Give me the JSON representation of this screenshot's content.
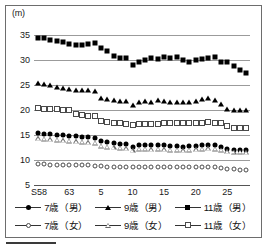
{
  "figure": {
    "unit_label": "(m)",
    "background": "#ffffff",
    "border_color": "#6d6d6d"
  },
  "axes": {
    "y_ticks": [
      "5",
      "10",
      "15",
      "20",
      "25",
      "30",
      "35"
    ],
    "y_min": 5,
    "y_max": 36.5,
    "x_ticks": [
      "S58",
      "63",
      "5",
      "10",
      "15",
      "20",
      "25"
    ],
    "x_tick_values": [
      0,
      5,
      10,
      15,
      20,
      25,
      30
    ],
    "x_min": -0.6,
    "x_max": 33.6,
    "grid": true,
    "grid_color": "#9b9b9b"
  },
  "legend": {
    "rows": [
      [
        {
          "label": "7歳（男）",
          "marker": "circle-f",
          "icon": "filled-circle-marker"
        },
        {
          "label": "9歳（男）",
          "marker": "tri-f",
          "icon": "filled-triangle-marker"
        },
        {
          "label": "11歳（男）",
          "marker": "square-f",
          "icon": "filled-square-marker"
        }
      ],
      [
        {
          "label": "7歳（女）",
          "marker": "circle-o",
          "icon": "open-circle-marker"
        },
        {
          "label": "9歳（女）",
          "marker": "tri-o",
          "icon": "open-triangle-marker"
        },
        {
          "label": "11歳（女）",
          "marker": "square-o",
          "icon": "open-square-marker"
        }
      ]
    ]
  },
  "chart_data": {
    "type": "line",
    "title": "",
    "subtitle": "",
    "xlabel": "",
    "ylabel": "(m)",
    "ylim": [
      5,
      36.5
    ],
    "xlim": [
      -0.6,
      33.6
    ],
    "grid": true,
    "legend_position": "bottom",
    "x": [
      0,
      1,
      2,
      3,
      4,
      5,
      6,
      7,
      8,
      9,
      10,
      11,
      12,
      13,
      14,
      15,
      16,
      17,
      18,
      19,
      20,
      21,
      22,
      23,
      24,
      25,
      26,
      27,
      28,
      29,
      30,
      31,
      32,
      33
    ],
    "x_tick_labels": [
      "S58",
      "63",
      "5",
      "10",
      "15",
      "20",
      "25"
    ],
    "x_tick_positions": [
      0,
      5,
      10,
      15,
      20,
      25,
      30
    ],
    "series": [
      {
        "name": "11歳（男）",
        "marker": "square-f",
        "values": [
          34.3,
          34.4,
          34.0,
          33.8,
          33.5,
          33.2,
          33.0,
          33.0,
          33.1,
          33.3,
          32.3,
          31.7,
          30.8,
          30.4,
          30.3,
          29.0,
          29.5,
          29.9,
          30.3,
          30.1,
          30.6,
          30.3,
          30.5,
          30.0,
          29.5,
          29.9,
          30.2,
          30.4,
          30.5,
          29.6,
          29.5,
          28.8,
          28.0,
          27.3
        ]
      },
      {
        "name": "9歳（男）",
        "marker": "tri-f",
        "values": [
          25.3,
          25.1,
          24.9,
          24.6,
          24.4,
          24.1,
          24.0,
          24.0,
          24.0,
          23.8,
          22.4,
          22.1,
          21.9,
          21.8,
          21.7,
          20.9,
          21.6,
          21.7,
          21.6,
          21.9,
          21.7,
          21.5,
          21.6,
          21.5,
          21.6,
          21.8,
          22.1,
          22.3,
          22.0,
          21.2,
          20.1,
          19.9,
          20.0,
          19.9
        ]
      },
      {
        "name": "11歳（女）",
        "marker": "square-o",
        "values": [
          20.3,
          20.2,
          20.2,
          20.2,
          20.0,
          20.0,
          19.1,
          18.9,
          18.8,
          18.8,
          17.7,
          17.5,
          17.4,
          17.3,
          17.2,
          17.0,
          17.2,
          17.2,
          17.1,
          17.2,
          17.3,
          17.3,
          17.4,
          17.3,
          17.3,
          17.4,
          17.4,
          17.5,
          17.4,
          17.3,
          16.7,
          16.4,
          16.4,
          16.3
        ]
      },
      {
        "name": "7歳（男）",
        "marker": "circle-f",
        "values": [
          15.3,
          15.2,
          15.1,
          15.0,
          14.9,
          14.8,
          14.7,
          14.6,
          14.5,
          14.4,
          13.7,
          13.5,
          13.3,
          13.2,
          13.1,
          12.6,
          13.0,
          13.0,
          12.9,
          13.0,
          12.9,
          12.8,
          12.7,
          12.6,
          12.7,
          12.8,
          13.0,
          13.0,
          12.9,
          12.6,
          12.2,
          12.0,
          12.0,
          11.9
        ]
      },
      {
        "name": "9歳（女）",
        "marker": "tri-o",
        "values": [
          14.3,
          14.2,
          14.1,
          14.0,
          13.9,
          13.8,
          13.7,
          13.6,
          13.5,
          13.4,
          12.8,
          12.6,
          12.5,
          12.4,
          12.3,
          11.9,
          12.2,
          12.2,
          12.1,
          12.2,
          12.1,
          12.0,
          12.0,
          11.9,
          12.0,
          12.1,
          12.2,
          12.3,
          12.2,
          12.0,
          11.7,
          11.6,
          11.6,
          11.5
        ]
      },
      {
        "name": "7歳（女）",
        "marker": "circle-o",
        "values": [
          9.1,
          9.1,
          9.0,
          9.0,
          9.0,
          9.0,
          8.9,
          8.9,
          8.9,
          8.8,
          8.7,
          8.6,
          8.6,
          8.6,
          8.6,
          8.5,
          8.5,
          8.5,
          8.5,
          8.5,
          8.5,
          8.5,
          8.5,
          8.5,
          8.5,
          8.5,
          8.5,
          8.5,
          8.5,
          8.4,
          8.2,
          8.1,
          8.0,
          8.0
        ]
      }
    ]
  }
}
